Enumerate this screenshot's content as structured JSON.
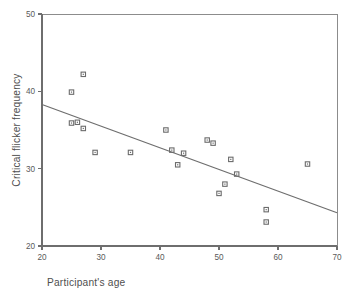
{
  "chart_data": {
    "type": "scatter",
    "title": "",
    "xlabel": "Participant's age",
    "ylabel": "Critical flicker frequency",
    "xlim": [
      20,
      70
    ],
    "ylim": [
      20,
      50
    ],
    "xticks": [
      "20",
      "30",
      "40",
      "50",
      "60",
      "70"
    ],
    "yticks": [
      "20",
      "30",
      "40",
      "50"
    ],
    "xtick_values": [
      20,
      30,
      40,
      50,
      60,
      70
    ],
    "ytick_values": [
      20,
      30,
      40,
      50
    ],
    "grid": false,
    "legend": null,
    "marker_style": "open-square",
    "points": [
      {
        "x": 25.0,
        "y": 39.9
      },
      {
        "x": 27.0,
        "y": 42.2
      },
      {
        "x": 25.0,
        "y": 35.9
      },
      {
        "x": 26.0,
        "y": 36.0
      },
      {
        "x": 27.0,
        "y": 35.2
      },
      {
        "x": 29.0,
        "y": 32.1
      },
      {
        "x": 35.0,
        "y": 32.1
      },
      {
        "x": 41.0,
        "y": 35.0
      },
      {
        "x": 42.0,
        "y": 32.4
      },
      {
        "x": 43.0,
        "y": 30.5
      },
      {
        "x": 44.0,
        "y": 32.0
      },
      {
        "x": 48.0,
        "y": 33.7
      },
      {
        "x": 49.0,
        "y": 33.3
      },
      {
        "x": 50.0,
        "y": 26.8
      },
      {
        "x": 51.0,
        "y": 28.0
      },
      {
        "x": 52.0,
        "y": 31.2
      },
      {
        "x": 53.0,
        "y": 29.3
      },
      {
        "x": 58.0,
        "y": 24.7
      },
      {
        "x": 58.0,
        "y": 23.1
      },
      {
        "x": 65.0,
        "y": 30.6
      }
    ],
    "trendline": {
      "type": "linear-fit",
      "x_start": 20,
      "y_start": 38.3,
      "x_end": 70,
      "y_end": 24.3,
      "slope": -0.28,
      "intercept": 43.9
    }
  },
  "colors": {
    "marker": "#6b6b6b",
    "axis": "#6e6e6e",
    "frame": "#8c8c8c",
    "trendline": "#6e6e6e",
    "text": "#4f4f4f",
    "background": "#ffffff"
  }
}
